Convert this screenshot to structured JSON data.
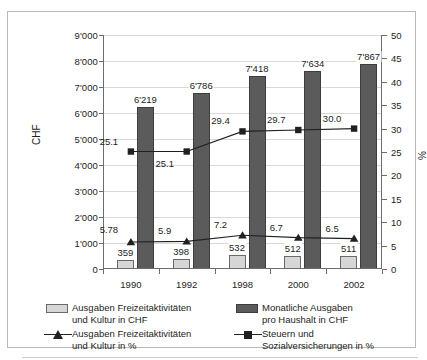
{
  "axis_titles": {
    "left": "CHF",
    "right": "%"
  },
  "chart_data": {
    "type": "bar",
    "title": "",
    "subtitle": "",
    "xlabel": "",
    "ylabel": "CHF",
    "y2label": "%",
    "grid": true,
    "legend_position": "bottom",
    "categories": [
      "1990",
      "1992",
      "1998",
      "2000",
      "2002"
    ],
    "ylim": [
      0,
      9000
    ],
    "yticks": [
      "0",
      "1'000",
      "2'000",
      "3'000",
      "4'000",
      "5'000",
      "6'000",
      "7'000",
      "8'000",
      "9'000"
    ],
    "ytick_values": [
      0,
      1000,
      2000,
      3000,
      4000,
      5000,
      6000,
      7000,
      8000,
      9000
    ],
    "y2lim": [
      0,
      50
    ],
    "y2ticks": [
      "0",
      "5",
      "10",
      "15",
      "20",
      "25",
      "30",
      "35",
      "40",
      "45",
      "50"
    ],
    "y2tick_values": [
      0,
      5,
      10,
      15,
      20,
      25,
      30,
      35,
      40,
      45,
      50
    ],
    "series": [
      {
        "name": "Ausgaben Freizeitaktivitäten und Kultur in CHF",
        "legend_line1": "Ausgaben Freizeitaktivitäten",
        "legend_line2": "und Kultur in CHF",
        "kind": "bar",
        "axis": "left",
        "color": "#d6d6d6",
        "border": "#6a6a6a",
        "values": [
          359,
          398,
          532,
          512,
          511
        ],
        "labels": [
          "359",
          "398",
          "532",
          "512",
          "511"
        ]
      },
      {
        "name": "Monatliche Ausgaben pro Haushalt in CHF",
        "legend_line1": "Monatliche Ausgaben",
        "legend_line2": "pro Haushalt in CHF",
        "kind": "bar",
        "axis": "left",
        "color": "#5b5b5b",
        "border": "#3d3d3d",
        "values": [
          6219,
          6786,
          7418,
          7634,
          7867
        ],
        "labels": [
          "6'219",
          "6'786",
          "7'418",
          "7'634",
          "7'867"
        ]
      },
      {
        "name": "Ausgaben Freizeitaktivitäten und Kultur in %",
        "legend_line1": "Ausgaben Freizeitaktivitäten",
        "legend_line2": "und Kultur in %",
        "kind": "line",
        "marker": "triangle",
        "axis": "right",
        "color": "#202020",
        "values": [
          5.78,
          5.9,
          7.2,
          6.7,
          6.5
        ],
        "labels": [
          "5.78",
          "5.9",
          "7.2",
          "6.7",
          "6.5"
        ]
      },
      {
        "name": "Steuern und Sozialversicherungen in %",
        "legend_line1": "Steuern und",
        "legend_line2": "Sozialversicherungen in %",
        "kind": "line",
        "marker": "square",
        "axis": "right",
        "color": "#202020",
        "values": [
          25.1,
          25.1,
          29.4,
          29.7,
          30.0
        ],
        "labels": [
          "25.1",
          "25.1",
          "29.4",
          "29.7",
          "30.0"
        ]
      }
    ]
  }
}
